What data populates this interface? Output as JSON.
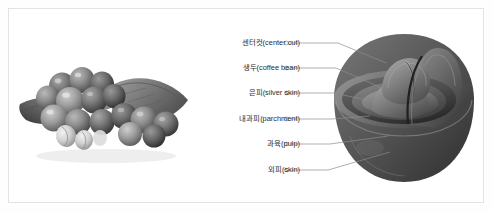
{
  "figure": {
    "kind": "coffee-cherry-anatomy-diagram",
    "border_color": "#e3e3e3",
    "background_color": "#ffffff",
    "text_color": "#2b2b2b",
    "leader_line_color": "#8c8c8c",
    "photo": {
      "name": "coffee-cherry-cluster-photo",
      "description": "grayscale photograph of a cluster of coffee cherries on a leaf"
    },
    "cross_section": {
      "name": "coffee-cherry-cross-section",
      "description": "grayscale cutaway rendering of a coffee cherry showing its layers"
    },
    "labels": [
      {
        "text": "센터컷(center cut)",
        "y": 27,
        "target_x": 86,
        "target_y": 47
      },
      {
        "text": "생두(coffee bean)",
        "y": 52,
        "target_x": 80,
        "target_y": 72
      },
      {
        "text": "은피(silver skin)",
        "y": 77,
        "target_x": 74,
        "target_y": 86
      },
      {
        "text": "내과피(parchment)",
        "y": 103,
        "target_x": 68,
        "target_y": 100
      },
      {
        "text": "과육(pulp)",
        "y": 128,
        "target_x": 96,
        "target_y": 120
      },
      {
        "text": "외피(skin)",
        "y": 154,
        "target_x": 100,
        "target_y": 139
      }
    ]
  }
}
